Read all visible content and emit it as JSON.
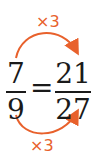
{
  "diagram": {
    "top_label": "×3",
    "bottom_label": "×3",
    "left_fraction": {
      "numerator": "7",
      "denominator": "9"
    },
    "equals": "=",
    "right_fraction": {
      "numerator": "21",
      "denominator": "27"
    },
    "colors": {
      "arrow": "#e8612c",
      "text": "#1a1a1a"
    }
  }
}
